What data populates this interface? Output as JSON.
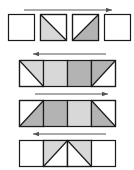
{
  "figure": {
    "title": "",
    "type": "tangram-strip-diagram",
    "canvas": {
      "width": 134,
      "height": 170,
      "background": "#ffffff"
    },
    "colors": {
      "stroke": "#1a1a1a",
      "white": "#ffffff",
      "light_gray": "#d8d8d8",
      "mid_gray": "#b3b3b3",
      "arrow": "#555555"
    },
    "rows": [
      {
        "name": "row-1",
        "y": 14,
        "separated": true,
        "cell_width": 26,
        "cell_height": 26,
        "gap": 6,
        "start_x": 8,
        "arrow": {
          "direction": "right",
          "x1": 24,
          "x2": 112,
          "y": 10
        },
        "cells": [
          {
            "fill": "white",
            "diagonal": "none",
            "triangle_fill": "",
            "triangle_side": ""
          },
          {
            "fill": "white",
            "diagonal": "tl-br",
            "triangle_fill": "light_gray",
            "triangle_side": "lower-left"
          },
          {
            "fill": "white",
            "diagonal": "bl-tr",
            "triangle_fill": "mid_gray",
            "triangle_side": "lower-right"
          },
          {
            "fill": "white",
            "diagonal": "none",
            "triangle_fill": "",
            "triangle_side": ""
          }
        ]
      },
      {
        "name": "row-2",
        "y": 60,
        "separated": false,
        "cell_width": 24,
        "cell_height": 26,
        "gap": 0,
        "start_x": 19,
        "arrow": {
          "direction": "left",
          "x1": 33,
          "x2": 106,
          "y": 54
        },
        "cells": [
          {
            "fill": "white",
            "diagonal": "tl-br",
            "triangle_fill": "light_gray",
            "triangle_side": "upper-right"
          },
          {
            "fill": "light_gray",
            "diagonal": "none",
            "triangle_fill": "",
            "triangle_side": ""
          },
          {
            "fill": "mid_gray",
            "diagonal": "none",
            "triangle_fill": "",
            "triangle_side": ""
          },
          {
            "fill": "white",
            "diagonal": "bl-tr",
            "triangle_fill": "mid_gray",
            "triangle_side": "upper-left"
          }
        ]
      },
      {
        "name": "row-3",
        "y": 100,
        "separated": false,
        "cell_width": 24,
        "cell_height": 26,
        "gap": 0,
        "start_x": 19,
        "arrow": {
          "direction": "right",
          "x1": 35,
          "x2": 108,
          "y": 94
        },
        "cells": [
          {
            "fill": "white",
            "diagonal": "bl-tr",
            "triangle_fill": "mid_gray",
            "triangle_side": "lower-right"
          },
          {
            "fill": "mid_gray",
            "diagonal": "none",
            "triangle_fill": "",
            "triangle_side": ""
          },
          {
            "fill": "light_gray",
            "diagonal": "none",
            "triangle_fill": "",
            "triangle_side": ""
          },
          {
            "fill": "white",
            "diagonal": "tl-br",
            "triangle_fill": "mid_gray",
            "triangle_side": "lower-left"
          }
        ]
      },
      {
        "name": "row-4",
        "y": 140,
        "separated": false,
        "cell_width": 24,
        "cell_height": 26,
        "gap": 0,
        "start_x": 19,
        "arrow": {
          "direction": "left",
          "x1": 33,
          "x2": 106,
          "y": 134
        },
        "cells": [
          {
            "fill": "white",
            "diagonal": "none",
            "triangle_fill": "",
            "triangle_side": ""
          },
          {
            "fill": "white",
            "diagonal": "bl-tr",
            "triangle_fill": "light_gray",
            "triangle_side": "upper-left"
          },
          {
            "fill": "white",
            "diagonal": "tl-br",
            "triangle_fill": "light_gray",
            "triangle_side": "upper-right"
          },
          {
            "fill": "white",
            "diagonal": "none",
            "triangle_fill": "",
            "triangle_side": ""
          }
        ]
      }
    ]
  }
}
